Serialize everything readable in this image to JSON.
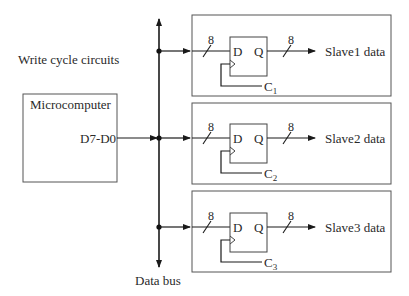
{
  "title": "Write cycle circuits",
  "microcomputer": {
    "label": "Microcomputer",
    "port": "D7-D0"
  },
  "bus": {
    "label": "Data bus"
  },
  "slaves": [
    {
      "input_width": "8",
      "output_width": "8",
      "d_label": "D",
      "q_label": "Q",
      "clock": "C",
      "clock_sub": "1",
      "output_label": "Slave1 data"
    },
    {
      "input_width": "8",
      "output_width": "8",
      "d_label": "D",
      "q_label": "Q",
      "clock": "C",
      "clock_sub": "2",
      "output_label": "Slave2 data"
    },
    {
      "input_width": "8",
      "output_width": "8",
      "d_label": "D",
      "q_label": "Q",
      "clock": "C",
      "clock_sub": "3",
      "output_label": "Slave3 data"
    }
  ],
  "colors": {
    "line": "#1a1a1a",
    "box": "#555555"
  }
}
